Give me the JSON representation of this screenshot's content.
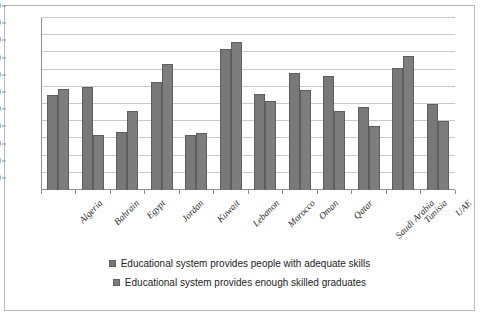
{
  "chart_data": {
    "type": "bar",
    "title": "",
    "subtitle": "",
    "xlabel": "",
    "ylabel": "",
    "ylim": [
      0,
      100
    ],
    "yticks": [
      0,
      10,
      20,
      30,
      40,
      50,
      60,
      70,
      80,
      90,
      100
    ],
    "grid": true,
    "legend_position": "bottom",
    "categories": [
      "Algeria",
      "Bahrain",
      "Egypt",
      "Jordan",
      "Kuwait",
      "Lebanon",
      "Morocco",
      "Oman",
      "Qatar",
      "Saudi Arabia",
      "Tunisia",
      "UAE"
    ],
    "series": [
      {
        "name": "Educational system provides people with adequate skills",
        "color": "#787878",
        "values": [
          55,
          60,
          34,
          63,
          32,
          82,
          56,
          68,
          66,
          48,
          71,
          50
        ]
      },
      {
        "name": "Educational system provides enough skilled graduates",
        "color": "#7d7d7d",
        "values": [
          59,
          32,
          46,
          73,
          33,
          86,
          52,
          58,
          46,
          37,
          78,
          40
        ]
      }
    ]
  },
  "legend": {
    "entries": [
      "Educational system provides people with adequate skills",
      "Educational system provides enough skilled graduates"
    ]
  }
}
